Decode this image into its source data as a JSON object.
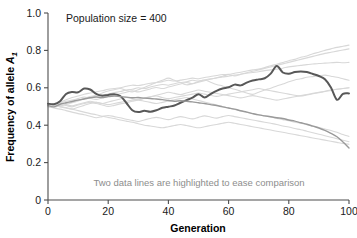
{
  "chart_data": {
    "type": "line",
    "title": "",
    "subtitle": "",
    "xlabel": "Generation",
    "ylabel": "Frequency of allele A1",
    "ylabel_base": "Frequency of allele ",
    "ylabel_symbol": "A",
    "ylabel_subscript": "1",
    "xlim": [
      0,
      100
    ],
    "ylim": [
      0,
      1.0
    ],
    "grid": false,
    "legend_position": "none",
    "x_ticks": [
      0,
      20,
      40,
      60,
      80,
      100
    ],
    "x_tick_labels": [
      "0",
      "20",
      "40",
      "60",
      "80",
      "100"
    ],
    "y_ticks": [
      0,
      0.2,
      0.4,
      0.6,
      0.8,
      1.0
    ],
    "y_tick_labels": [
      "0",
      "0.2",
      "0.4",
      "0.6",
      "0.8",
      "1.0"
    ],
    "annotations": [
      {
        "id": "population-size",
        "text": "Population size = 400",
        "x": 6,
        "y": 0.955,
        "color": "#1a1a1a"
      },
      {
        "id": "highlight-caption",
        "text": "Two data lines are highlighted to ease comparison",
        "x": 50,
        "y": 0.145,
        "color": "#8d8d8d"
      }
    ],
    "colors": {
      "background_lines": "#d8d8d8",
      "highlight_dark": "#585858",
      "highlight_medium": "#9a9a9a",
      "axis": "#4d4d4d",
      "text": "#1a1a1a",
      "caption_text": "#8d8d8d"
    },
    "x": [
      0,
      2,
      4,
      6,
      8,
      10,
      12,
      14,
      16,
      18,
      20,
      22,
      24,
      26,
      28,
      30,
      32,
      34,
      36,
      38,
      40,
      42,
      44,
      46,
      48,
      50,
      52,
      54,
      56,
      58,
      60,
      62,
      64,
      66,
      68,
      70,
      72,
      74,
      76,
      78,
      80,
      82,
      84,
      86,
      88,
      90,
      92,
      94,
      96,
      98,
      100
    ],
    "series": [
      {
        "name": "replicate-1-highlight-dark",
        "style": "highlight-dark",
        "highlighted": true,
        "width": 2.0,
        "color": "#585858",
        "values": [
          0.515,
          0.512,
          0.528,
          0.567,
          0.578,
          0.576,
          0.596,
          0.591,
          0.568,
          0.558,
          0.562,
          0.566,
          0.556,
          0.52,
          0.48,
          0.47,
          0.477,
          0.472,
          0.48,
          0.493,
          0.499,
          0.505,
          0.52,
          0.534,
          0.547,
          0.566,
          0.548,
          0.566,
          0.584,
          0.596,
          0.603,
          0.617,
          0.613,
          0.628,
          0.639,
          0.645,
          0.651,
          0.676,
          0.716,
          0.682,
          0.675,
          0.684,
          0.687,
          0.684,
          0.674,
          0.663,
          0.646,
          0.602,
          0.536,
          0.568,
          0.57
        ]
      },
      {
        "name": "replicate-2-highlight-medium",
        "style": "highlight-medium",
        "highlighted": true,
        "width": 1.4,
        "color": "#9a9a9a",
        "values": [
          0.505,
          0.498,
          0.512,
          0.52,
          0.527,
          0.534,
          0.54,
          0.547,
          0.551,
          0.548,
          0.553,
          0.556,
          0.553,
          0.55,
          0.547,
          0.548,
          0.545,
          0.543,
          0.54,
          0.537,
          0.532,
          0.528,
          0.531,
          0.528,
          0.525,
          0.52,
          0.516,
          0.51,
          0.505,
          0.498,
          0.492,
          0.486,
          0.477,
          0.47,
          0.462,
          0.455,
          0.45,
          0.445,
          0.44,
          0.436,
          0.428,
          0.422,
          0.413,
          0.405,
          0.395,
          0.385,
          0.372,
          0.356,
          0.338,
          0.31,
          0.278
        ]
      },
      {
        "name": "replicate-3",
        "style": "background",
        "highlighted": false,
        "width": 1.1,
        "color": "#d8d8d8",
        "values": [
          0.51,
          0.515,
          0.523,
          0.536,
          0.548,
          0.556,
          0.566,
          0.572,
          0.578,
          0.584,
          0.592,
          0.596,
          0.6,
          0.608,
          0.614,
          0.612,
          0.618,
          0.624,
          0.628,
          0.633,
          0.64,
          0.636,
          0.641,
          0.646,
          0.652,
          0.648,
          0.655,
          0.66,
          0.666,
          0.671,
          0.672,
          0.678,
          0.683,
          0.69,
          0.696,
          0.7,
          0.708,
          0.718,
          0.726,
          0.735,
          0.745,
          0.752,
          0.763,
          0.77,
          0.782,
          0.79,
          0.8,
          0.808,
          0.816,
          0.822,
          0.828
        ]
      },
      {
        "name": "replicate-4",
        "style": "background",
        "highlighted": false,
        "width": 1.1,
        "color": "#d8d8d8",
        "values": [
          0.505,
          0.509,
          0.502,
          0.514,
          0.524,
          0.533,
          0.542,
          0.548,
          0.556,
          0.562,
          0.566,
          0.574,
          0.58,
          0.588,
          0.592,
          0.6,
          0.596,
          0.604,
          0.612,
          0.618,
          0.614,
          0.622,
          0.628,
          0.632,
          0.64,
          0.636,
          0.642,
          0.648,
          0.652,
          0.658,
          0.662,
          0.668,
          0.672,
          0.678,
          0.682,
          0.686,
          0.692,
          0.696,
          0.7,
          0.705,
          0.712,
          0.716,
          0.72,
          0.724,
          0.727,
          0.73,
          0.732,
          0.734,
          0.736,
          0.734,
          0.736
        ]
      },
      {
        "name": "replicate-5",
        "style": "background",
        "highlighted": false,
        "width": 1.1,
        "color": "#d8d8d8",
        "values": [
          0.5,
          0.496,
          0.505,
          0.512,
          0.52,
          0.53,
          0.542,
          0.553,
          0.56,
          0.572,
          0.583,
          0.59,
          0.596,
          0.586,
          0.578,
          0.59,
          0.602,
          0.615,
          0.628,
          0.64,
          0.652,
          0.64,
          0.628,
          0.616,
          0.622,
          0.634,
          0.642,
          0.63,
          0.618,
          0.61,
          0.6,
          0.592,
          0.582,
          0.572,
          0.565,
          0.576,
          0.588,
          0.598,
          0.61,
          0.62,
          0.632,
          0.642,
          0.648,
          0.656,
          0.66,
          0.664,
          0.668,
          0.662,
          0.656,
          0.648,
          0.64
        ]
      },
      {
        "name": "replicate-6",
        "style": "background",
        "highlighted": false,
        "width": 1.1,
        "color": "#d8d8d8",
        "values": [
          0.515,
          0.508,
          0.498,
          0.492,
          0.486,
          0.496,
          0.506,
          0.516,
          0.522,
          0.516,
          0.51,
          0.516,
          0.522,
          0.528,
          0.534,
          0.54,
          0.546,
          0.552,
          0.556,
          0.548,
          0.542,
          0.548,
          0.554,
          0.56,
          0.566,
          0.572,
          0.566,
          0.56,
          0.554,
          0.56,
          0.566,
          0.572,
          0.578,
          0.584,
          0.59,
          0.596,
          0.59,
          0.584,
          0.578,
          0.572,
          0.566,
          0.56,
          0.556,
          0.562,
          0.568,
          0.574,
          0.58,
          0.586,
          0.592,
          0.596,
          0.6
        ]
      },
      {
        "name": "replicate-7",
        "style": "background",
        "highlighted": false,
        "width": 1.1,
        "color": "#d8d8d8",
        "values": [
          0.508,
          0.502,
          0.51,
          0.505,
          0.498,
          0.508,
          0.516,
          0.522,
          0.516,
          0.508,
          0.5,
          0.506,
          0.514,
          0.52,
          0.528,
          0.534,
          0.528,
          0.522,
          0.516,
          0.522,
          0.53,
          0.536,
          0.542,
          0.548,
          0.54,
          0.532,
          0.524,
          0.516,
          0.508,
          0.5,
          0.492,
          0.484,
          0.476,
          0.47,
          0.462,
          0.456,
          0.45,
          0.444,
          0.436,
          0.43,
          0.424,
          0.416,
          0.41,
          0.402,
          0.396,
          0.388,
          0.38,
          0.372,
          0.362,
          0.35,
          0.34
        ]
      },
      {
        "name": "replicate-8",
        "style": "background",
        "highlighted": false,
        "width": 1.1,
        "color": "#d8d8d8",
        "values": [
          0.498,
          0.492,
          0.486,
          0.478,
          0.47,
          0.462,
          0.456,
          0.448,
          0.44,
          0.446,
          0.452,
          0.446,
          0.44,
          0.432,
          0.426,
          0.42,
          0.428,
          0.436,
          0.442,
          0.436,
          0.43,
          0.438,
          0.446,
          0.44,
          0.434,
          0.442,
          0.45,
          0.444,
          0.438,
          0.446,
          0.452,
          0.446,
          0.44,
          0.434,
          0.428,
          0.422,
          0.416,
          0.41,
          0.404,
          0.396,
          0.39,
          0.382,
          0.376,
          0.368,
          0.36,
          0.352,
          0.344,
          0.336,
          0.328,
          0.32,
          0.312
        ]
      },
      {
        "name": "replicate-9",
        "style": "background",
        "highlighted": false,
        "width": 1.1,
        "color": "#d8d8d8",
        "values": [
          0.512,
          0.506,
          0.5,
          0.494,
          0.486,
          0.478,
          0.47,
          0.462,
          0.456,
          0.448,
          0.442,
          0.436,
          0.428,
          0.422,
          0.416,
          0.408,
          0.4,
          0.396,
          0.39,
          0.386,
          0.392,
          0.398,
          0.404,
          0.398,
          0.392,
          0.386,
          0.392,
          0.398,
          0.404,
          0.41,
          0.416,
          0.41,
          0.404,
          0.398,
          0.392,
          0.386,
          0.38,
          0.374,
          0.368,
          0.362,
          0.356,
          0.35,
          0.344,
          0.338,
          0.332,
          0.326,
          0.32,
          0.314,
          0.308,
          0.302,
          0.298
        ]
      },
      {
        "name": "replicate-10",
        "style": "background",
        "highlighted": false,
        "width": 1.1,
        "color": "#d8d8d8",
        "values": [
          0.502,
          0.508,
          0.516,
          0.51,
          0.504,
          0.512,
          0.52,
          0.528,
          0.522,
          0.516,
          0.524,
          0.532,
          0.54,
          0.548,
          0.542,
          0.536,
          0.544,
          0.552,
          0.56,
          0.568,
          0.576,
          0.57,
          0.564,
          0.572,
          0.58,
          0.588,
          0.582,
          0.576,
          0.57,
          0.564,
          0.558,
          0.552,
          0.546,
          0.552,
          0.558,
          0.552,
          0.546,
          0.54,
          0.534,
          0.54,
          0.546,
          0.552,
          0.558,
          0.564,
          0.57,
          0.576,
          0.582,
          0.588,
          0.592,
          0.596,
          0.6
        ]
      },
      {
        "name": "replicate-11",
        "style": "background",
        "highlighted": false,
        "width": 1.1,
        "color": "#d8d8d8",
        "values": [
          0.506,
          0.512,
          0.52,
          0.528,
          0.534,
          0.542,
          0.55,
          0.544,
          0.538,
          0.546,
          0.554,
          0.562,
          0.568,
          0.576,
          0.584,
          0.578,
          0.586,
          0.594,
          0.602,
          0.596,
          0.604,
          0.612,
          0.62,
          0.628,
          0.622,
          0.63,
          0.638,
          0.646,
          0.654,
          0.662,
          0.67,
          0.664,
          0.672,
          0.68,
          0.688,
          0.696,
          0.704,
          0.712,
          0.72,
          0.728,
          0.736,
          0.744,
          0.752,
          0.76,
          0.768,
          0.776,
          0.784,
          0.79,
          0.796,
          0.802,
          0.808
        ]
      }
    ]
  }
}
